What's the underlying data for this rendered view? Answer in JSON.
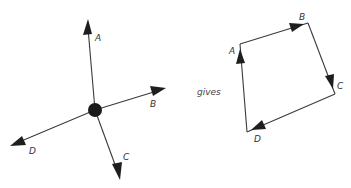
{
  "diagram": {
    "left": {
      "description": "Four vectors acting at a point",
      "vectors": [
        {
          "label": "A"
        },
        {
          "label": "B"
        },
        {
          "label": "C"
        },
        {
          "label": "D"
        }
      ]
    },
    "connector": "gives",
    "right": {
      "description": "Vectors placed head-to-tail forming a closed polygon",
      "vertices": [
        {
          "label": "A"
        },
        {
          "label": "B"
        },
        {
          "label": "C"
        },
        {
          "label": "D"
        }
      ]
    },
    "colors": {
      "line": "#3a3a3a",
      "arrowhead": "#1e1e1e",
      "point": "#1a1a1a"
    }
  }
}
